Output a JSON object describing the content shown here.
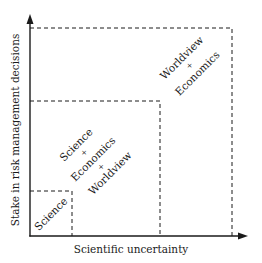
{
  "diagram": {
    "x_axis": {
      "label": "Scientific uncertainty"
    },
    "y_axis": {
      "label": "Stake in risk management decisions"
    },
    "regions": [
      {
        "id": "science",
        "lines": [
          "Science"
        ]
      },
      {
        "id": "science-economics-worldview",
        "lines": [
          "Science",
          "+",
          "Economics",
          "+",
          "Worldview"
        ]
      },
      {
        "id": "worldview-economics",
        "lines": [
          "Worldview",
          "+",
          "Economics"
        ]
      }
    ],
    "colors": {
      "line": "#1a1a1a",
      "background": "#ffffff"
    }
  }
}
